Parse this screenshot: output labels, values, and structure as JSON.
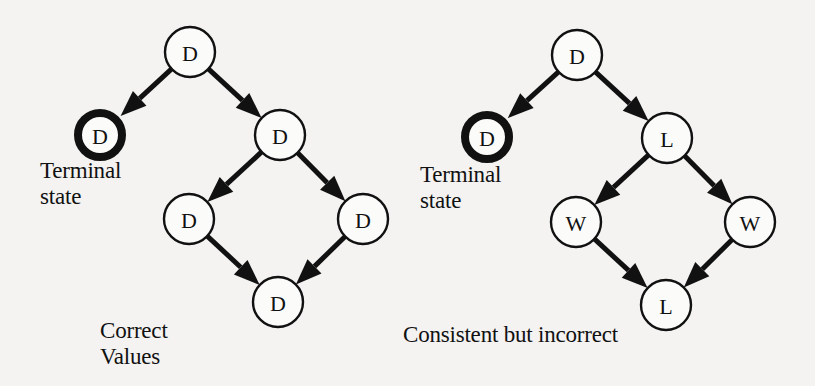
{
  "figure": {
    "left_diagram": {
      "caption": [
        "Correct",
        "Values"
      ],
      "terminal_caption": [
        "Terminal",
        "state"
      ],
      "nodes": [
        {
          "id": "l-root",
          "label": "D",
          "x": 190,
          "y": 52,
          "terminal": false
        },
        {
          "id": "l-terminal",
          "label": "D",
          "x": 100,
          "y": 135,
          "terminal": true
        },
        {
          "id": "l-mid",
          "label": "D",
          "x": 280,
          "y": 135,
          "terminal": false
        },
        {
          "id": "l-lower-left",
          "label": "D",
          "x": 189,
          "y": 219,
          "terminal": false
        },
        {
          "id": "l-lower-right",
          "label": "D",
          "x": 363,
          "y": 219,
          "terminal": false
        },
        {
          "id": "l-bottom",
          "label": "D",
          "x": 278,
          "y": 302,
          "terminal": false
        }
      ],
      "edges": [
        [
          "l-root",
          "l-terminal"
        ],
        [
          "l-root",
          "l-mid"
        ],
        [
          "l-mid",
          "l-lower-left"
        ],
        [
          "l-mid",
          "l-lower-right"
        ],
        [
          "l-lower-left",
          "l-bottom"
        ],
        [
          "l-lower-right",
          "l-bottom"
        ]
      ]
    },
    "right_diagram": {
      "caption": [
        "Consistent but incorrect"
      ],
      "terminal_caption": [
        "Terminal",
        "state"
      ],
      "nodes": [
        {
          "id": "r-root",
          "label": "D",
          "x": 577,
          "y": 55,
          "terminal": false
        },
        {
          "id": "r-terminal",
          "label": "D",
          "x": 487,
          "y": 137,
          "terminal": true
        },
        {
          "id": "r-mid",
          "label": "L",
          "x": 667,
          "y": 138,
          "terminal": false
        },
        {
          "id": "r-lower-left",
          "label": "W",
          "x": 576,
          "y": 222,
          "terminal": false
        },
        {
          "id": "r-lower-right",
          "label": "W",
          "x": 750,
          "y": 222,
          "terminal": false
        },
        {
          "id": "r-bottom",
          "label": "L",
          "x": 666,
          "y": 305,
          "terminal": false
        }
      ],
      "edges": [
        [
          "r-root",
          "r-terminal"
        ],
        [
          "r-root",
          "r-mid"
        ],
        [
          "r-mid",
          "r-lower-left"
        ],
        [
          "r-mid",
          "r-lower-right"
        ],
        [
          "r-lower-left",
          "r-bottom"
        ],
        [
          "r-lower-right",
          "r-bottom"
        ]
      ]
    },
    "node_radius": 25,
    "colors": {
      "ink": "#111111",
      "paper": "#f4f3f1"
    }
  }
}
